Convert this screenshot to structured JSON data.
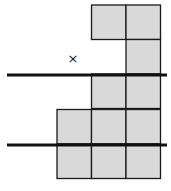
{
  "diagram": {
    "cell_size": 35,
    "fill_color": "#d9d9d9",
    "stroke_color": "#1a1a1a",
    "cells": [
      {
        "col": 1,
        "row": 0
      },
      {
        "col": 2,
        "row": 0
      },
      {
        "col": 2,
        "row": 1
      },
      {
        "col": 1,
        "row": 2
      },
      {
        "col": 2,
        "row": 2
      },
      {
        "col": 0,
        "row": 3
      },
      {
        "col": 1,
        "row": 3
      },
      {
        "col": 2,
        "row": 3
      },
      {
        "col": 0,
        "row": 4
      },
      {
        "col": 1,
        "row": 4
      },
      {
        "col": 2,
        "row": 4
      }
    ],
    "heavy_lines_y": [
      75,
      145
    ],
    "marker": {
      "symbol": "×",
      "x": 73,
      "y": 59
    }
  }
}
